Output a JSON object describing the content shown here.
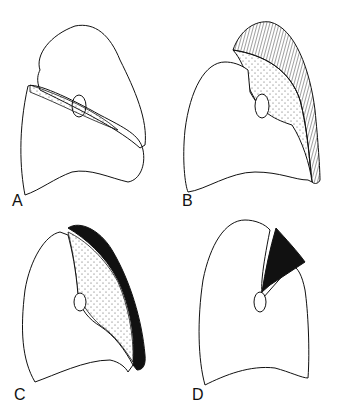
{
  "figure": {
    "panels": [
      {
        "label": "A",
        "description": "Lung outline with collapsed upper-lobe wedge along fissure, hilum oval"
      },
      {
        "label": "B",
        "description": "Lung with hatched apical cap and stippled collapsed lobe along lateral margin"
      },
      {
        "label": "C",
        "description": "Lung with solid black band along lateral/apical margin and stippled zone"
      },
      {
        "label": "D",
        "description": "Lung with solid black triangular wedge from hilum to apex"
      }
    ],
    "colors": {
      "line": "#111111",
      "background": "#ffffff",
      "fill_black": "#111111"
    }
  }
}
